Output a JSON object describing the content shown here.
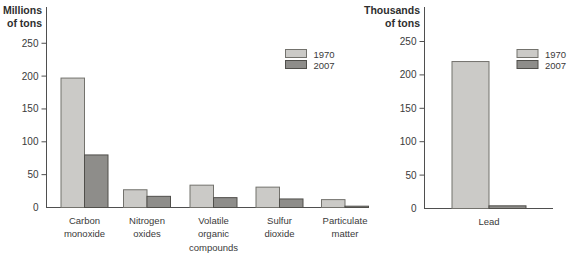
{
  "figure": {
    "width": 573,
    "height": 254,
    "background": "#ffffff",
    "description_title": ""
  },
  "colors": {
    "series": {
      "1970": {
        "fill": "#cbcac7",
        "stroke": "#73726d"
      },
      "2007": {
        "fill": "#8e8d8a",
        "stroke": "#504f4b"
      }
    },
    "axis": "#4f4f4f",
    "text": "#3a3a3a"
  },
  "legend": {
    "entries": [
      "1970",
      "2007"
    ]
  },
  "chart_data": [
    {
      "type": "bar",
      "title": "",
      "unit_label": "Millions of tons",
      "unit_label_lines": [
        "Millions",
        "of tons"
      ],
      "categories": [
        "Carbon monoxide",
        "Nitrogen oxides",
        "Volatile organic compounds",
        "Sulfur dioxide",
        "Particulate matter"
      ],
      "category_lines": [
        [
          "Carbon",
          "monoxide"
        ],
        [
          "Nitrogen",
          "oxides"
        ],
        [
          "Volatile",
          "organic",
          "compounds"
        ],
        [
          "Sulfur",
          "dioxide"
        ],
        [
          "Particulate",
          "matter"
        ]
      ],
      "series": [
        {
          "name": "1970",
          "values": [
            197,
            27,
            34,
            31,
            12
          ]
        },
        {
          "name": "2007",
          "values": [
            80,
            17,
            15,
            13,
            2
          ]
        }
      ],
      "xlabel": "",
      "ylabel": "Millions of tons",
      "ylim": [
        0,
        250
      ],
      "yticks": [
        0,
        50,
        100,
        150,
        200,
        250
      ],
      "grid": false,
      "legend_position": "upper-right-of-plot"
    },
    {
      "type": "bar",
      "title": "",
      "unit_label": "Thousands of tons",
      "unit_label_lines": [
        "Thousands",
        "of tons"
      ],
      "categories": [
        "Lead"
      ],
      "category_lines": [
        [
          "Lead"
        ]
      ],
      "series": [
        {
          "name": "1970",
          "values": [
            220
          ]
        },
        {
          "name": "2007",
          "values": [
            4
          ]
        }
      ],
      "xlabel": "",
      "ylabel": "Thousands of tons",
      "ylim": [
        0,
        250
      ],
      "yticks": [
        0,
        50,
        100,
        150,
        200,
        250
      ],
      "grid": false,
      "legend_position": "upper-right-of-plot"
    }
  ]
}
